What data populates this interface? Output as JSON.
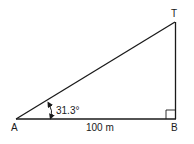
{
  "diagram": {
    "type": "right-triangle",
    "vertices": {
      "A": {
        "label": "A"
      },
      "B": {
        "label": "B"
      },
      "T": {
        "label": "T"
      }
    },
    "angle_at_A": {
      "label": "31.3°",
      "value_deg": 31.3
    },
    "base_AB": {
      "label": "100 m",
      "value": 100,
      "unit": "m"
    },
    "right_angle_at": "B",
    "colors": {
      "stroke": "#1a1a1a",
      "background": "#ffffff"
    }
  }
}
